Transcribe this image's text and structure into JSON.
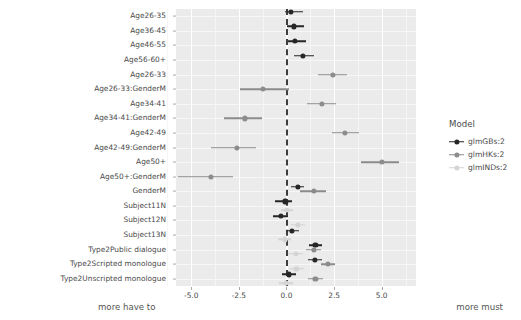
{
  "chart_data": {
    "type": "scatter",
    "subtype": "forest-plot",
    "title": "",
    "xlabel": "",
    "ylabel": "",
    "xlim": [
      -5.8,
      6.8
    ],
    "xticks": [
      -5.0,
      -2.5,
      0.0,
      2.5,
      5.0
    ],
    "xticklabels": [
      "-5.0",
      "-2.5",
      "0.0",
      "2.5",
      "5.0"
    ],
    "grid": true,
    "legend_position": "right",
    "reference_line": {
      "x": 0.0,
      "style": "dashed",
      "color": "#3d3d3d"
    },
    "axis_annotations": {
      "left": "more have to",
      "right": "more must"
    },
    "categories": [
      "Age26-35",
      "Age36-45",
      "Age46-55",
      "Age56-60+",
      "Age26-33",
      "Age26-33:GenderM",
      "Age34-41",
      "Age34-41:GenderM",
      "Age42-49",
      "Age42-49:GenderM",
      "Age50+",
      "Age50+:GenderM",
      "GenderM",
      "Subject11N",
      "Subject12N",
      "Subject13N",
      "Type2Public dialogue",
      "Type2Scripted monologue",
      "Type2Unscripted monologue"
    ],
    "series": [
      {
        "name": "glmGBs:2",
        "color": "#262626",
        "points": [
          {
            "category": "Age26-35",
            "estimate": 0.22,
            "low": -0.08,
            "high": 0.88
          },
          {
            "category": "Age36-45",
            "estimate": 0.38,
            "low": 0.04,
            "high": 0.92
          },
          {
            "category": "Age46-55",
            "estimate": 0.46,
            "low": 0.06,
            "high": 1.02
          },
          {
            "category": "Age56-60+",
            "estimate": 0.88,
            "low": 0.42,
            "high": 1.44
          },
          {
            "category": "Age26-33",
            "estimate": null,
            "low": null,
            "high": null
          },
          {
            "category": "Age26-33:GenderM",
            "estimate": null,
            "low": null,
            "high": null
          },
          {
            "category": "Age34-41",
            "estimate": null,
            "low": null,
            "high": null
          },
          {
            "category": "Age34-41:GenderM",
            "estimate": null,
            "low": null,
            "high": null
          },
          {
            "category": "Age42-49",
            "estimate": null,
            "low": null,
            "high": null
          },
          {
            "category": "Age42-49:GenderM",
            "estimate": null,
            "low": null,
            "high": null
          },
          {
            "category": "Age50+",
            "estimate": null,
            "low": null,
            "high": null
          },
          {
            "category": "Age50+:GenderM",
            "estimate": null,
            "low": null,
            "high": null
          },
          {
            "category": "GenderM",
            "estimate": 0.58,
            "low": 0.26,
            "high": 0.92
          },
          {
            "category": "Subject11N",
            "estimate": -0.06,
            "low": -0.62,
            "high": 0.28
          },
          {
            "category": "Subject12N",
            "estimate": -0.28,
            "low": -0.72,
            "high": 0.06
          },
          {
            "category": "Subject13N",
            "estimate": 0.3,
            "low": -0.02,
            "high": 0.68
          },
          {
            "category": "Type2Public dialogue",
            "estimate": 1.52,
            "low": 1.18,
            "high": 1.88
          },
          {
            "category": "Type2Scripted monologue",
            "estimate": 1.48,
            "low": 1.14,
            "high": 1.84
          },
          {
            "category": "Type2Unscripted monologue",
            "estimate": 0.12,
            "low": -0.22,
            "high": 0.5
          }
        ]
      },
      {
        "name": "glmHKs:2",
        "color": "#8c8c8c",
        "points": [
          {
            "category": "Age26-35",
            "estimate": null,
            "low": null,
            "high": null
          },
          {
            "category": "Age36-45",
            "estimate": null,
            "low": null,
            "high": null
          },
          {
            "category": "Age46-55",
            "estimate": null,
            "low": null,
            "high": null
          },
          {
            "category": "Age56-60+",
            "estimate": null,
            "low": null,
            "high": null
          },
          {
            "category": "Age26-33",
            "estimate": 2.42,
            "low": 1.64,
            "high": 3.18
          },
          {
            "category": "Age26-33:GenderM",
            "estimate": -1.22,
            "low": -2.42,
            "high": 0.12
          },
          {
            "category": "Age34-41",
            "estimate": 1.88,
            "low": 1.06,
            "high": 2.62
          },
          {
            "category": "Age34-41:GenderM",
            "estimate": -2.18,
            "low": -3.28,
            "high": -1.26
          },
          {
            "category": "Age42-49",
            "estimate": 3.08,
            "low": 2.38,
            "high": 3.8
          },
          {
            "category": "Age42-49:GenderM",
            "estimate": -2.62,
            "low": -3.98,
            "high": -1.62
          },
          {
            "category": "Age50+",
            "estimate": 5.02,
            "low": 3.92,
            "high": 5.92
          },
          {
            "category": "Age50+:GenderM",
            "estimate": -3.98,
            "low": -5.7,
            "high": -2.82
          },
          {
            "category": "GenderM",
            "estimate": 1.42,
            "low": 0.72,
            "high": 2.08
          },
          {
            "category": "Subject11N",
            "estimate": null,
            "low": null,
            "high": null
          },
          {
            "category": "Subject12N",
            "estimate": null,
            "low": null,
            "high": null
          },
          {
            "category": "Subject13N",
            "estimate": null,
            "low": null,
            "high": null
          },
          {
            "category": "Type2Public dialogue",
            "estimate": 1.42,
            "low": 1.04,
            "high": 1.82
          },
          {
            "category": "Type2Scripted monologue",
            "estimate": 2.18,
            "low": 1.8,
            "high": 2.56
          },
          {
            "category": "Type2Unscripted monologue",
            "estimate": 1.52,
            "low": 1.14,
            "high": 1.92
          }
        ]
      },
      {
        "name": "glmINDs:2",
        "color": "#d4d4d4",
        "points": [
          {
            "category": "Age26-35",
            "estimate": null,
            "low": null,
            "high": null
          },
          {
            "category": "Age36-45",
            "estimate": null,
            "low": null,
            "high": null
          },
          {
            "category": "Age46-55",
            "estimate": null,
            "low": null,
            "high": null
          },
          {
            "category": "Age56-60+",
            "estimate": null,
            "low": null,
            "high": null
          },
          {
            "category": "Age26-33",
            "estimate": null,
            "low": null,
            "high": null
          },
          {
            "category": "Age26-33:GenderM",
            "estimate": null,
            "low": null,
            "high": null
          },
          {
            "category": "Age34-41",
            "estimate": null,
            "low": null,
            "high": null
          },
          {
            "category": "Age34-41:GenderM",
            "estimate": null,
            "low": null,
            "high": null
          },
          {
            "category": "Age42-49",
            "estimate": null,
            "low": null,
            "high": null
          },
          {
            "category": "Age42-49:GenderM",
            "estimate": null,
            "low": null,
            "high": null
          },
          {
            "category": "Age50+",
            "estimate": null,
            "low": null,
            "high": null
          },
          {
            "category": "Age50+:GenderM",
            "estimate": null,
            "low": null,
            "high": null
          },
          {
            "category": "GenderM",
            "estimate": null,
            "low": null,
            "high": null
          },
          {
            "category": "Subject11N",
            "estimate": 0.02,
            "low": -0.3,
            "high": 0.34
          },
          {
            "category": "Subject12N",
            "estimate": 0.62,
            "low": 0.26,
            "high": 0.98
          },
          {
            "category": "Subject13N",
            "estimate": -0.1,
            "low": -0.44,
            "high": 0.26
          },
          {
            "category": "Type2Public dialogue",
            "estimate": 0.48,
            "low": 0.1,
            "high": 0.86
          },
          {
            "category": "Type2Scripted monologue",
            "estimate": 0.52,
            "low": 0.14,
            "high": 0.92
          },
          {
            "category": "Type2Unscripted monologue",
            "estimate": -0.04,
            "low": -0.38,
            "high": 0.34
          }
        ]
      }
    ]
  },
  "legend": {
    "title": "Model"
  }
}
